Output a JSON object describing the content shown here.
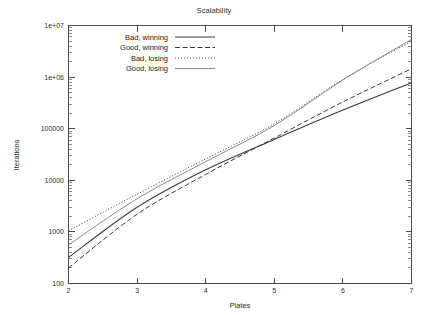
{
  "chart_data": {
    "type": "line",
    "title": "Scalability",
    "xlabel": "Plates",
    "ylabel": "Iterations",
    "xlim": [
      2,
      7
    ],
    "ylim": [
      100,
      10000000
    ],
    "yscale": "log",
    "xscale": "linear",
    "grid": false,
    "legend_position": "upper-left-inside",
    "xticks": [
      "2",
      "3",
      "4",
      "5",
      "6",
      "7"
    ],
    "xtick_values": [
      2,
      3,
      4,
      5,
      6,
      7
    ],
    "yticks": [
      "100",
      "1000",
      "10000",
      "100000",
      "1e+06",
      "1e+07"
    ],
    "ytick_values": [
      100,
      1000,
      10000,
      100000,
      1000000,
      10000000
    ],
    "x": [
      2,
      3,
      4,
      5,
      6,
      7
    ],
    "series": [
      {
        "name": "Bad, winning",
        "style": "solid",
        "color": "#3a3a3a",
        "width": 1.1,
        "values": [
          320,
          3000,
          16000,
          62000,
          230000,
          780000
        ]
      },
      {
        "name": "Good, winning",
        "style": "dashed",
        "color": "#3a3a3a",
        "width": 1.0,
        "values": [
          200,
          2200,
          13000,
          66000,
          330000,
          1450000
        ]
      },
      {
        "name": "Bad, losing",
        "style": "dotted",
        "color": "#555555",
        "width": 1.0,
        "values": [
          1050,
          5400,
          26000,
          125000,
          900000,
          5000000
        ]
      },
      {
        "name": "Good, losing",
        "style": "solid-light",
        "color": "#8a8a8a",
        "width": 1.0,
        "values": [
          560,
          4400,
          23000,
          115000,
          880000,
          5400000
        ]
      }
    ]
  },
  "legend": {
    "entries": [
      {
        "label": "Bad, winning"
      },
      {
        "label": "Good, winning"
      },
      {
        "label": "Bad, losing"
      },
      {
        "label": "Good, losing"
      }
    ]
  },
  "icons": {
    "line-sample": "line-sample-icon"
  }
}
